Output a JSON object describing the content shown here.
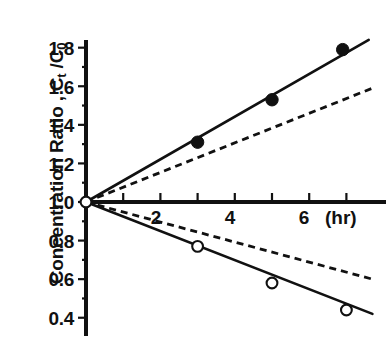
{
  "chart_data": {
    "type": "scatter",
    "title": "",
    "xlabel": "(hr)",
    "ylabel": "Concentration Ratio , Ct /C0",
    "ylabel_parts": {
      "prefix": "Concentration Ratio , C",
      "sub1": "t",
      "mid": " /C",
      "sub2": "0"
    },
    "x_unit": "(hr)",
    "xlim": [
      0,
      8
    ],
    "ylim": [
      0.32,
      1.9
    ],
    "grid": false,
    "legend": "none",
    "xticks": [
      0,
      1,
      2,
      3,
      4,
      5,
      6,
      7
    ],
    "xticklabels": [
      "",
      "",
      "2",
      "",
      "4",
      "",
      "6",
      ""
    ],
    "yticks": [
      0.4,
      0.6,
      0.8,
      1.0,
      1.2,
      1.4,
      1.6,
      1.8
    ],
    "yticklabels": [
      "0.4",
      "0.6",
      "0.8",
      "1.0",
      "1.2",
      "1.4",
      "1.6",
      "1.8"
    ],
    "origin_value": 1.0,
    "series": [
      {
        "name": "upper-filled-points",
        "marker": "filled-circle",
        "x": [
          0,
          3,
          5,
          6.9
        ],
        "values": [
          1.0,
          1.31,
          1.53,
          1.79
        ]
      },
      {
        "name": "lower-open-points",
        "marker": "open-circle",
        "x": [
          0,
          3,
          5,
          7.0
        ],
        "values": [
          1.0,
          0.77,
          0.58,
          0.44
        ]
      }
    ],
    "lines": [
      {
        "name": "upper-solid-fit",
        "style": "solid",
        "x": [
          0,
          7.6
        ],
        "values": [
          1.0,
          1.84
        ]
      },
      {
        "name": "upper-dashed-fit",
        "style": "dashed",
        "x": [
          0,
          7.7
        ],
        "values": [
          1.0,
          1.59
        ]
      },
      {
        "name": "lower-solid-fit",
        "style": "solid",
        "x": [
          0,
          7.7
        ],
        "values": [
          1.0,
          0.42
        ]
      },
      {
        "name": "lower-dashed-fit",
        "style": "dashed",
        "x": [
          0,
          7.7
        ],
        "values": [
          1.0,
          0.6
        ]
      }
    ],
    "colors": {
      "ink": "#111111",
      "background": "#ffffff"
    }
  }
}
